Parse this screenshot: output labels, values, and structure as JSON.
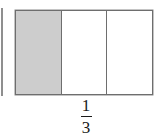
{
  "figure": {
    "kind": "fraction-bar-model",
    "background_color": "#ffffff",
    "bar": {
      "border_color": "#6e6e6e",
      "unshaded_color": "#ffffff",
      "shaded_color": "#cdcdcd",
      "total_parts": 3,
      "shaded_parts": 1,
      "cells": [
        {
          "index": 1,
          "state": "shaded",
          "fill": "#cdcdcd"
        },
        {
          "index": 2,
          "state": "unshaded",
          "fill": "#ffffff"
        },
        {
          "index": 3,
          "state": "unshaded",
          "fill": "#ffffff"
        }
      ]
    },
    "label": {
      "text": "1/3",
      "numerator": "1",
      "denominator": "3",
      "color": "#1a1a1a"
    },
    "edge_sliver": {
      "description": "cropped edge of adjacent figure",
      "color": "#8f8f8f"
    }
  }
}
